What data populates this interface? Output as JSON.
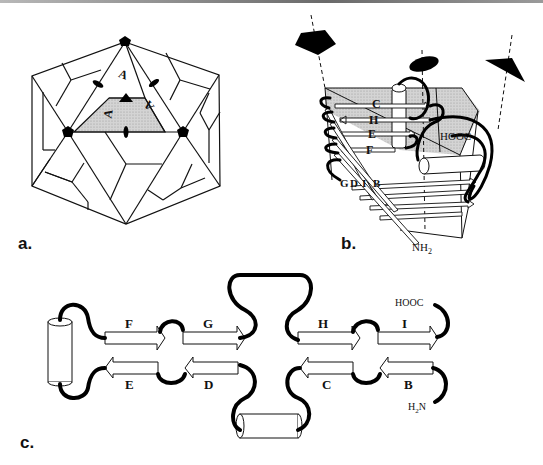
{
  "figure": {
    "panels": [
      {
        "id": "a",
        "label": "a."
      },
      {
        "id": "b",
        "label": "b."
      },
      {
        "id": "c",
        "label": "c."
      }
    ]
  },
  "panel_a": {
    "label": "a.",
    "subunit_labels": [
      "A",
      "A",
      "A"
    ],
    "shaded_color": "#c8c8c8",
    "symmetry_symbols": [
      "5-fold pentagon",
      "3-fold triangle",
      "2-fold ellipse"
    ]
  },
  "panel_b": {
    "label": "b.",
    "strand_labels_top": [
      "C",
      "H",
      "E",
      "F"
    ],
    "strand_labels_bottom": [
      "G",
      "D",
      "I",
      "B"
    ],
    "c_terminus": "HOOC",
    "n_terminus": "NH",
    "n_terminus_sub": "2",
    "shaded_color": "#cfcfcf"
  },
  "panel_c": {
    "label": "c.",
    "top_strands": [
      "F",
      "G",
      "H",
      "I"
    ],
    "bottom_strands": [
      "E",
      "D",
      "C",
      "B"
    ],
    "c_terminus": "HOOC",
    "n_terminus_h": "H",
    "n_terminus_sub": "2",
    "n_terminus_n": "N"
  }
}
